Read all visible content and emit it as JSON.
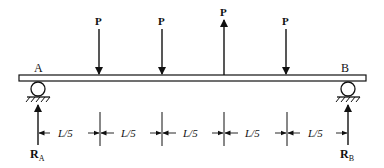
{
  "diagram": {
    "support_labels": {
      "left": "A",
      "right": "B"
    },
    "loads": [
      {
        "label": "P",
        "direction": "down",
        "position": "L/5"
      },
      {
        "label": "P",
        "direction": "down",
        "position": "2L/5"
      },
      {
        "label": "P",
        "direction": "up",
        "position": "3L/5"
      },
      {
        "label": "P",
        "direction": "down",
        "position": "4L/5"
      }
    ],
    "reactions": {
      "left": "R",
      "left_sub": "A",
      "right": "R",
      "right_sub": "B"
    },
    "spans": [
      "L/5",
      "L/5",
      "L/5",
      "L/5",
      "L/5"
    ],
    "colors": {
      "line": "#111111",
      "beam_fill": "#ffffff"
    }
  }
}
